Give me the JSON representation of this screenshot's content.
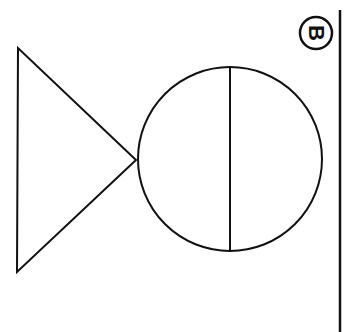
{
  "diagram": {
    "label": "B",
    "stroke_color": "#111111",
    "background": "#ffffff",
    "shapes": {
      "triangle": {
        "points": [
          [
            18,
            48
          ],
          [
            17,
            272
          ],
          [
            136,
            160
          ]
        ]
      },
      "circle": {
        "cx": 230,
        "cy": 159,
        "r": 92
      },
      "circle_divider": {
        "x": 230,
        "y1": 67,
        "y2": 251
      },
      "right_border_line": {
        "x": 340,
        "y1": 10,
        "y2": 332
      },
      "label_badge": {
        "cx": 316,
        "cy": 33,
        "r": 16
      }
    }
  }
}
